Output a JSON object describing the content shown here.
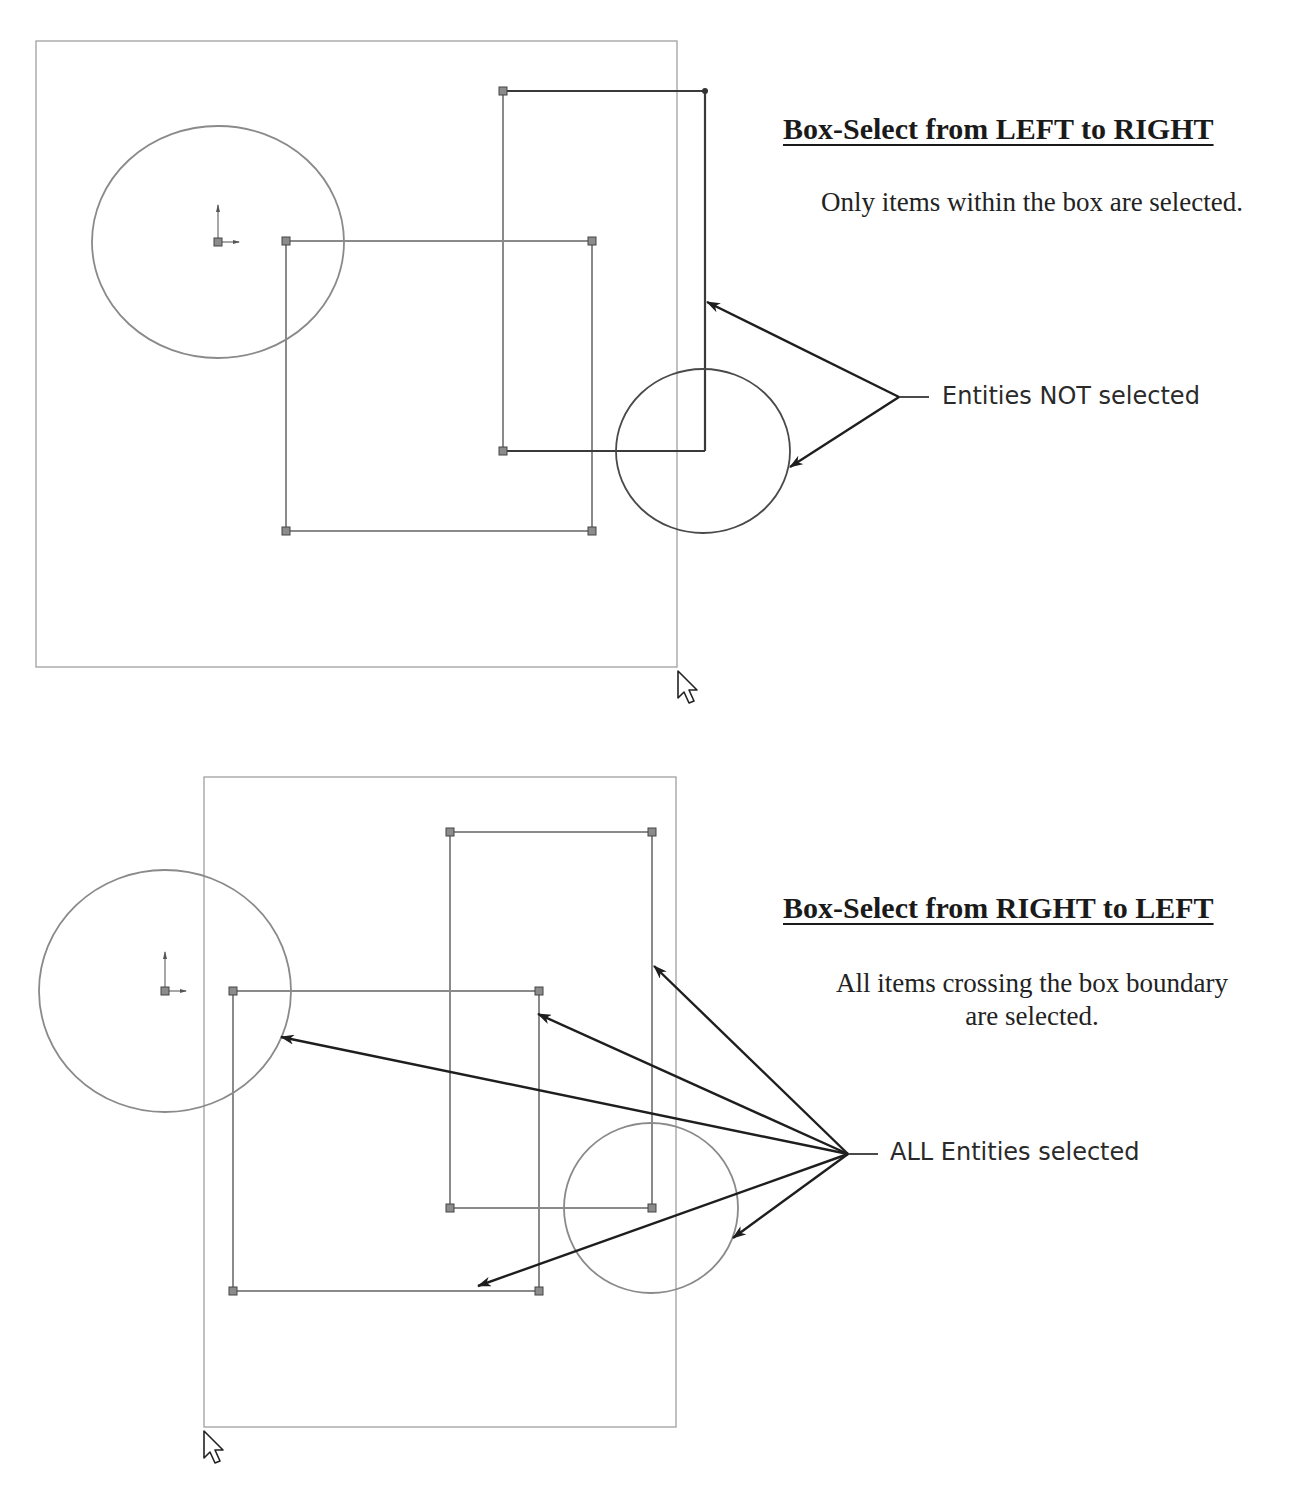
{
  "panels": [
    {
      "heading": "Box-Select from LEFT to RIGHT",
      "description": "Only items within the box are selected.",
      "callout": "Entities NOT selected",
      "selection_box": {
        "x1": 36,
        "y1": 41,
        "x2": 677,
        "y2": 667
      },
      "cursor": {
        "x": 678,
        "y": 671
      }
    },
    {
      "heading": "Box-Select from RIGHT to LEFT",
      "description_line1": "All items crossing the box boundary",
      "description_line2": "are selected.",
      "callout": "ALL Entities selected",
      "selection_box": {
        "x1": 204,
        "y1": 777,
        "x2": 676,
        "y2": 1427
      },
      "cursor": {
        "x": 204,
        "y": 1431
      }
    }
  ],
  "colors": {
    "sketch_gray": "#8a8a8a",
    "sketch_dark": "#3a3a3a",
    "box_border": "#9a9a9a",
    "arrow": "#1e1e1e",
    "endpoint_fill": "#8c8c8c"
  }
}
